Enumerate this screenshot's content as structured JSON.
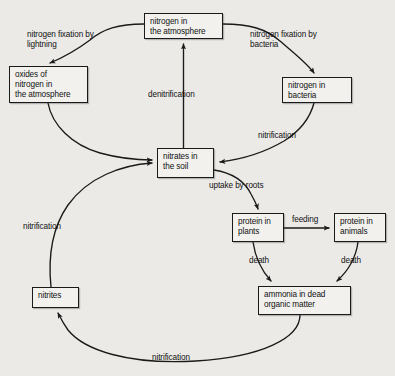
{
  "diagram": {
    "background_color": "#eceae7",
    "line_color": "#1a1a1a",
    "nodes": [
      {
        "id": "atmosphere",
        "label": "nitrogen in\nthe atmosphere",
        "x": 144,
        "y": 13,
        "w": 79,
        "h": 26
      },
      {
        "id": "oxides",
        "label": "oxides of\nnitrogen in\nthe atmosphere",
        "x": 9,
        "y": 66,
        "w": 79,
        "h": 37
      },
      {
        "id": "bacteria",
        "label": "nitrogen in\nbacteria",
        "x": 282,
        "y": 77,
        "w": 70,
        "h": 26
      },
      {
        "id": "nitrates",
        "label": "nitrates in\nthe soil",
        "x": 157,
        "y": 148,
        "w": 57,
        "h": 30
      },
      {
        "id": "plants",
        "label": "protein in\nplants",
        "x": 232,
        "y": 213,
        "w": 52,
        "h": 29
      },
      {
        "id": "animals",
        "label": "protein in\nanimals",
        "x": 334,
        "y": 213,
        "w": 52,
        "h": 29
      },
      {
        "id": "ammonia",
        "label": "ammonia in dead\norganic matter",
        "x": 258,
        "y": 286,
        "w": 93,
        "h": 29
      },
      {
        "id": "nitrites",
        "label": "nitrites",
        "x": 32,
        "y": 287,
        "w": 47,
        "h": 21
      }
    ],
    "edges": [
      {
        "id": "fix-lightning",
        "label": "nitrogen fixation by\nlightning",
        "from": "atmosphere",
        "to": "oxides"
      },
      {
        "id": "fix-bacteria",
        "label": "nitrogen fixation by\nbacteria",
        "from": "atmosphere",
        "to": "bacteria"
      },
      {
        "id": "denitrification",
        "label": "denitrification",
        "from": "nitrates",
        "to": "atmosphere"
      },
      {
        "id": "oxides-to-nitrates",
        "label": "",
        "from": "oxides",
        "to": "nitrates"
      },
      {
        "id": "nitrification-bacteria",
        "label": "nitrification",
        "from": "bacteria",
        "to": "nitrates"
      },
      {
        "id": "uptake-by-roots",
        "label": "uptake by roots",
        "from": "nitrates",
        "to": "plants"
      },
      {
        "id": "feeding",
        "label": "feeding",
        "from": "plants",
        "to": "animals"
      },
      {
        "id": "death-plants",
        "label": "death",
        "from": "plants",
        "to": "ammonia"
      },
      {
        "id": "death-animals",
        "label": "death",
        "from": "animals",
        "to": "ammonia"
      },
      {
        "id": "nitrification-bottom",
        "label": "nitrification",
        "from": "ammonia",
        "to": "nitrites"
      },
      {
        "id": "nitrification-left",
        "label": "nitrification",
        "from": "nitrites",
        "to": "nitrates"
      }
    ]
  }
}
